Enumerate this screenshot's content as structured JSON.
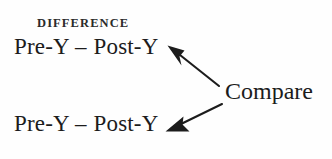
{
  "figure": {
    "width": 332,
    "height": 159,
    "background_color": "#fefefe",
    "ink_color": "#1c1c1c"
  },
  "header": {
    "label": "DIFFERENCE"
  },
  "expressions": [
    {
      "id": "difference-top",
      "left_term": "Pre-Y",
      "operator": "–",
      "right_term": "Post-Y",
      "full_text": "Pre-Y – Post-Y"
    },
    {
      "id": "difference-bottom",
      "left_term": "Pre-Y",
      "operator": "–",
      "right_term": "Post-Y",
      "full_text": "Pre-Y – Post-Y"
    }
  ],
  "annotation": {
    "label": "Compare"
  },
  "arrows": [
    {
      "id": "arrow-to-top-expression",
      "icon": "arrow-up-left-icon",
      "from_x": 219,
      "from_y": 86,
      "to_x": 168,
      "to_y": 46
    },
    {
      "id": "arrow-to-bottom-expression",
      "icon": "arrow-down-left-icon",
      "from_x": 222,
      "from_y": 104,
      "to_x": 166,
      "to_y": 131
    }
  ]
}
